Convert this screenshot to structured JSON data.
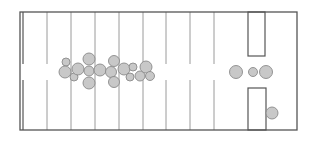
{
  "diagram": {
    "width": 315,
    "height": 141,
    "colors": {
      "frame": "#555555",
      "line": "#9a9a9a",
      "circle_fill": "#c8c8c8",
      "circle_stroke": "#8a8a8a",
      "background": "#ffffff"
    },
    "frame": {
      "x": 20,
      "y": 12,
      "w": 277,
      "h": 118
    },
    "inner_left_line": {
      "x": 23,
      "y1": 12,
      "y2": 130,
      "gap": [
        64,
        80
      ]
    },
    "vertical_lines": [
      {
        "x": 47,
        "gap": [
          64,
          80
        ]
      },
      {
        "x": 71,
        "gap": null
      },
      {
        "x": 95,
        "gap": null
      },
      {
        "x": 119,
        "gap": null
      },
      {
        "x": 143,
        "gap": null
      },
      {
        "x": 166,
        "gap": [
          64,
          80
        ]
      },
      {
        "x": 190,
        "gap": [
          64,
          80
        ]
      },
      {
        "x": 214,
        "gap": [
          64,
          80
        ]
      }
    ],
    "rectangles": [
      {
        "name": "upper-bay",
        "x": 248,
        "y": 12,
        "w": 17,
        "h": 44
      },
      {
        "name": "lower-bay",
        "x": 248,
        "y": 88,
        "w": 18,
        "h": 42
      }
    ],
    "circles": [
      {
        "cx": 66,
        "cy": 62,
        "r": 4
      },
      {
        "cx": 65,
        "cy": 72,
        "r": 6
      },
      {
        "cx": 74,
        "cy": 77,
        "r": 4
      },
      {
        "cx": 78,
        "cy": 69,
        "r": 6
      },
      {
        "cx": 89,
        "cy": 59,
        "r": 6
      },
      {
        "cx": 89,
        "cy": 71,
        "r": 5
      },
      {
        "cx": 89,
        "cy": 83,
        "r": 6
      },
      {
        "cx": 100,
        "cy": 70,
        "r": 6
      },
      {
        "cx": 111,
        "cy": 72,
        "r": 5.5
      },
      {
        "cx": 114,
        "cy": 61,
        "r": 5.5
      },
      {
        "cx": 114,
        "cy": 82,
        "r": 5.5
      },
      {
        "cx": 124,
        "cy": 69,
        "r": 6
      },
      {
        "cx": 133,
        "cy": 67,
        "r": 4
      },
      {
        "cx": 130,
        "cy": 77,
        "r": 4
      },
      {
        "cx": 140,
        "cy": 76,
        "r": 5
      },
      {
        "cx": 146,
        "cy": 67,
        "r": 6
      },
      {
        "cx": 150,
        "cy": 76,
        "r": 4.5
      },
      {
        "cx": 236,
        "cy": 72,
        "r": 6.5
      },
      {
        "cx": 253,
        "cy": 72,
        "r": 4.5
      },
      {
        "cx": 266,
        "cy": 72,
        "r": 6.5
      },
      {
        "cx": 272,
        "cy": 113,
        "r": 6
      }
    ]
  }
}
